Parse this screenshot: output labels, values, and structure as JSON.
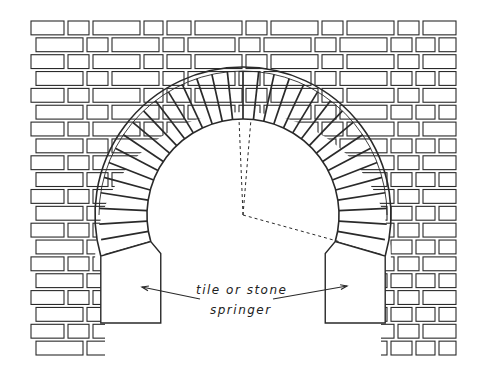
{
  "diagram": {
    "type": "brick-arch-elevation",
    "annotation": {
      "line1": "tile or stone",
      "line2": "springer"
    },
    "colors": {
      "stroke": "#2a2a2a",
      "background": "#ffffff"
    },
    "geometry": {
      "arch_center": [
        243,
        215
      ],
      "outer_radius": 148,
      "inner_radius": 96,
      "springer_bottom_y": 323,
      "wall_left": 30,
      "wall_right": 458,
      "wall_top": 20,
      "wall_bottom": 357,
      "course_height": 16.85
    }
  }
}
